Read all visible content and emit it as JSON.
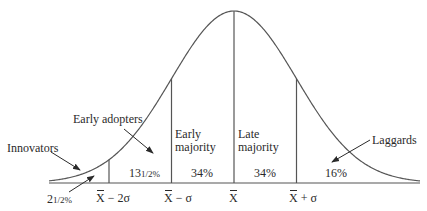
{
  "categories": [
    {
      "name": "Innovators",
      "share": "2½%",
      "share_whole": "2",
      "share_frac": "1/2%"
    },
    {
      "name": "Early adopters",
      "share": "13½%",
      "share_whole": "13",
      "share_frac": "1/2%"
    },
    {
      "name_line1": "Early",
      "name_line2": "majority",
      "share": "34%"
    },
    {
      "name_line1": "Late",
      "name_line2": "majority",
      "share": "34%"
    },
    {
      "name": "Laggards",
      "share": "16%"
    }
  ],
  "axis_marks": [
    {
      "symbol": "X",
      "suffix": " − 2σ"
    },
    {
      "symbol": "X",
      "suffix": " − σ"
    },
    {
      "symbol": "X",
      "suffix": ""
    },
    {
      "symbol": "X",
      "suffix": " + σ"
    }
  ],
  "colors": {
    "ink": "#2a2a2a",
    "background": "#ffffff"
  }
}
